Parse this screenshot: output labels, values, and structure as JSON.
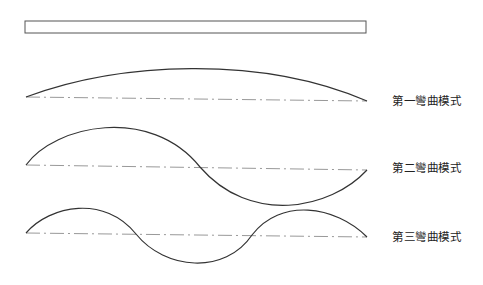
{
  "diagram": {
    "beam": {
      "x": 25,
      "y": 21,
      "width": 341,
      "height": 12
    },
    "modes": [
      {
        "label": "第一彎曲模式",
        "label_pos": {
          "x": 392,
          "y": 92
        },
        "axis": {
          "x1": 26,
          "y1": 97,
          "x2": 367,
          "y2": 101
        },
        "curve": "M26,97 C120,62 260,55 367,101"
      },
      {
        "label": "第二彎曲模式",
        "label_pos": {
          "x": 392,
          "y": 159
        },
        "axis": {
          "x1": 26,
          "y1": 165,
          "x2": 367,
          "y2": 170
        },
        "curve": "M26,165 C55,125 150,105 200,167 C250,225 330,210 367,170"
      },
      {
        "label": "第三彎曲模式",
        "label_pos": {
          "x": 392,
          "y": 228
        },
        "axis": {
          "x1": 26,
          "y1": 233,
          "x2": 367,
          "y2": 237
        },
        "curve": "M26,233 C50,205 105,195 136,234 C165,270 225,275 252,235 C280,198 335,205 367,237"
      }
    ],
    "colors": {
      "stroke": "#333333",
      "axis": "#999999"
    }
  }
}
